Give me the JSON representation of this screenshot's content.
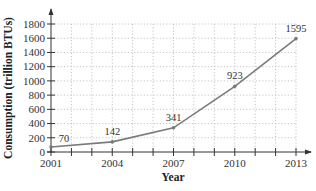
{
  "chart_data": {
    "type": "line",
    "title": "",
    "xlabel": "Year",
    "ylabel": "Consumption (trillion BTUs)",
    "x": [
      2001,
      2004,
      2007,
      2010,
      2013
    ],
    "series": [
      {
        "name": "Consumption",
        "values": [
          70,
          142,
          341,
          923,
          1595
        ]
      }
    ],
    "data_labels": [
      "70",
      "142",
      "341",
      "923",
      "1595"
    ],
    "x_ticks": [
      "2001",
      "2004",
      "2007",
      "2010",
      "2013"
    ],
    "x_minor_ticks": [
      2001,
      2002,
      2003,
      2004,
      2005,
      2006,
      2007,
      2008,
      2009,
      2010,
      2011,
      2012,
      2013
    ],
    "y_ticks": [
      "0",
      "200",
      "400",
      "600",
      "800",
      "1000",
      "1200",
      "1400",
      "1600",
      "1800"
    ],
    "xlim": [
      2001,
      2013
    ],
    "ylim": [
      0,
      1800
    ],
    "grid": true,
    "legend": "none",
    "colors": {
      "line": "#7a7a7a",
      "marker": "#7a7a7a",
      "grid": "#b5b5b5",
      "axis": "#333333"
    }
  }
}
